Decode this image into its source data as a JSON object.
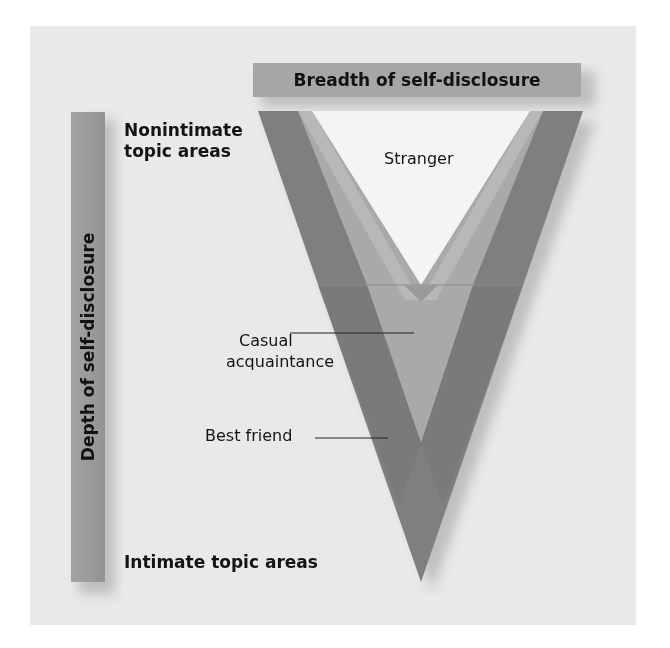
{
  "diagram": {
    "title_axis_horizontal": "Breadth of self-disclosure",
    "title_axis_vertical": "Depth of self-disclosure",
    "top_label": "Nonintimate topic areas",
    "top_label_line1": "Nonintimate",
    "top_label_line2": "topic areas",
    "bottom_label": "Intimate topic areas",
    "relationships": [
      {
        "label": "Stranger",
        "shade": "lightest",
        "color": "#f4f4f4"
      },
      {
        "label": "Casual acquaintance",
        "line1": "Casual",
        "line2": "acquaintance",
        "shade": "medium",
        "color": "#a9a9a9"
      },
      {
        "label": "Best friend",
        "shade": "darkest",
        "color": "#7d7d7d"
      }
    ],
    "colors": {
      "background": "#e9e9e9",
      "bar": "#9a9a9a",
      "best_friend": "#7d7d7d",
      "casual_acquaintance": "#a9a9a9",
      "casual_inner": "#b7b7b7",
      "stranger": "#f4f4f4",
      "text": "#141414"
    }
  }
}
